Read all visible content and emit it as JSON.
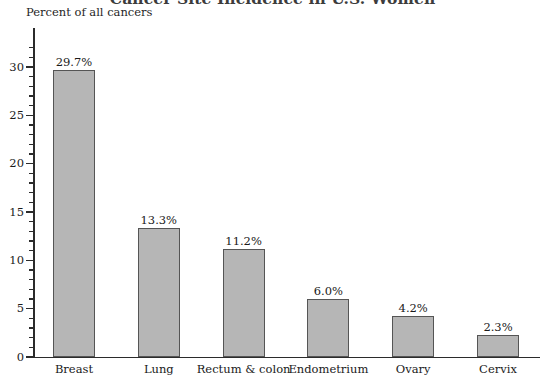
{
  "chart_data": {
    "type": "bar",
    "title": "Cancer Site Incidence in U.S. Women",
    "xlabel": "",
    "ylabel": "Percent of all cancers",
    "categories": [
      "Breast",
      "Lung",
      "Rectum & colon",
      "Endometrium",
      "Ovary",
      "Cervix"
    ],
    "values": [
      29.7,
      13.3,
      11.2,
      6.0,
      4.2,
      2.3
    ],
    "value_labels": [
      "29.7%",
      "13.3%",
      "11.2%",
      "6.0%",
      "4.2%",
      "2.3%"
    ],
    "ylim": [
      0,
      32
    ],
    "ytick_labels": [
      "0",
      "5",
      "10",
      "15",
      "20",
      "25",
      "30"
    ],
    "ytick_values": [
      0,
      5,
      10,
      15,
      20,
      25,
      30
    ],
    "yminor_step": 1,
    "grid": false,
    "legend": null,
    "bar_color": "#b6b6b6",
    "bar_edge_color": "#555555",
    "axis_color": "#2b2b2b"
  }
}
